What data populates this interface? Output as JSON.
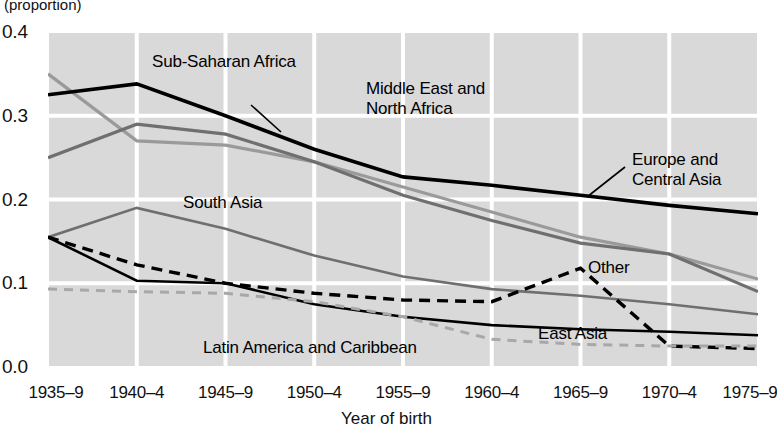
{
  "axes": {
    "y_label_top": "(proportion)",
    "y_ticks": [
      "0.4",
      "0.3",
      "0.2",
      "0.1",
      "0.0"
    ],
    "y_min": 0.0,
    "y_max": 0.4,
    "x_title": "Year of birth"
  },
  "annotations": {
    "sub_saharan_africa": "Sub-Saharan Africa",
    "middle_east_line1": "Middle East and",
    "middle_east_line2": "North Africa",
    "europe_line1": "Europe and",
    "europe_line2": "Central Asia",
    "south_asia": "South Asia",
    "other": "Other",
    "east_asia": "East Asia",
    "latin_america": "Latin America and Caribbean"
  },
  "colors": {
    "plot_background": "#d9d9d9",
    "gridline": "#ffffff",
    "black_thick": "#000000",
    "black_thin": "#000000",
    "mid_gray": "#6f6f6f",
    "light_gray": "#9a9a9a",
    "dashed_dark": "#000000",
    "dashed_light": "#a8a8a8"
  },
  "chart_data": {
    "type": "line",
    "title": "",
    "subtitle": "",
    "xlabel": "Year of birth",
    "ylabel": "(proportion)",
    "ylim": [
      0.0,
      0.4
    ],
    "grid": true,
    "legend": "inline-annotations",
    "categories": [
      "1935–9",
      "1940–4",
      "1945–9",
      "1950–4",
      "1955–9",
      "1960–4",
      "1965–9",
      "1970–4",
      "1975–9"
    ],
    "series": [
      {
        "name": "Europe and Central Asia",
        "style": "solid",
        "color": "#9a9a9a",
        "width": 3.2,
        "values": [
          0.35,
          0.27,
          0.265,
          0.245,
          0.215,
          0.185,
          0.155,
          0.135,
          0.105
        ]
      },
      {
        "name": "Sub-Saharan Africa",
        "style": "solid",
        "color": "#000000",
        "width": 3.6,
        "values": [
          0.325,
          0.338,
          0.3,
          0.26,
          0.227,
          0.217,
          0.205,
          0.193,
          0.183
        ]
      },
      {
        "name": "Middle East and North Africa",
        "style": "solid",
        "color": "#6f6f6f",
        "width": 3.2,
        "values": [
          0.25,
          0.29,
          0.278,
          0.245,
          0.205,
          0.175,
          0.148,
          0.135,
          0.09
        ]
      },
      {
        "name": "South Asia",
        "style": "solid",
        "color": "#6f6f6f",
        "width": 2.6,
        "values": [
          0.155,
          0.19,
          0.165,
          0.133,
          0.108,
          0.093,
          0.085,
          0.075,
          0.063
        ]
      },
      {
        "name": "Other",
        "style": "dashed",
        "color": "#000000",
        "width": 3.4,
        "values": [
          0.155,
          0.122,
          0.1,
          0.088,
          0.08,
          0.078,
          0.118,
          0.025,
          0.022
        ]
      },
      {
        "name": "East Asia",
        "style": "solid",
        "color": "#000000",
        "width": 2.6,
        "values": [
          0.155,
          0.103,
          0.1,
          0.075,
          0.06,
          0.05,
          0.045,
          0.042,
          0.038
        ]
      },
      {
        "name": "Latin America and Caribbean",
        "style": "dashed",
        "color": "#a8a8a8",
        "width": 3.0,
        "values": [
          0.093,
          0.09,
          0.088,
          0.078,
          0.06,
          0.033,
          0.027,
          0.025,
          0.025
        ]
      }
    ]
  }
}
